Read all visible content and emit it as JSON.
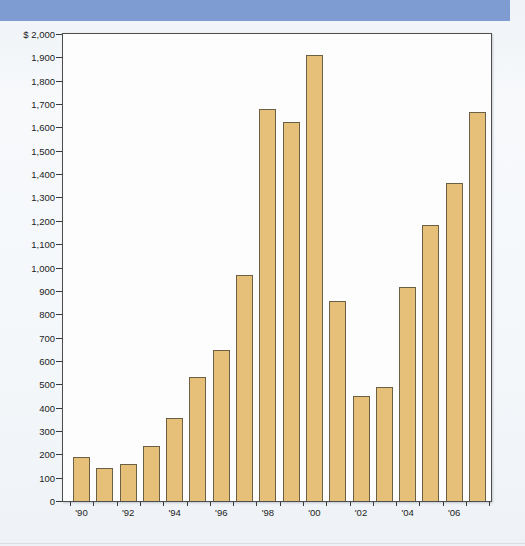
{
  "header": {
    "color": "#7e9bd2"
  },
  "colors": {
    "page_background": "#f2f5f8",
    "plot_background": "#fdfdfe",
    "plot_border": "#4d4d4d",
    "bar_fill": "#e6c078",
    "bar_border": "#6b6044",
    "axis": "#3a3a3a",
    "text": "#1c1c1c",
    "bottom_divider": "#d9dee3"
  },
  "chart_data": {
    "type": "bar",
    "title": "",
    "xlabel": "",
    "ylabel": "",
    "grid": false,
    "legend": null,
    "ylim": [
      0,
      2000
    ],
    "ytick_step": 100,
    "categories": [
      "'90",
      "'91",
      "'92",
      "'93",
      "'94",
      "'95",
      "'96",
      "'97",
      "'98",
      "'99",
      "'00",
      "'01",
      "'02",
      "'03",
      "'04",
      "'05",
      "'06",
      "'07"
    ],
    "values": [
      190,
      140,
      160,
      235,
      355,
      530,
      645,
      970,
      1680,
      1625,
      1910,
      855,
      450,
      490,
      915,
      1180,
      1360,
      1665
    ],
    "x_tick_labels": [
      "'90",
      "",
      "'92",
      "",
      "'94",
      "",
      "'96",
      "",
      "'98",
      "",
      "'00",
      "",
      "'02",
      "",
      "'04",
      "",
      "'06",
      ""
    ],
    "y_tick_values": [
      2000,
      1900,
      1800,
      1700,
      1600,
      1500,
      1400,
      1300,
      1200,
      1100,
      1000,
      900,
      800,
      700,
      600,
      500,
      400,
      300,
      200,
      100,
      0
    ],
    "y_tick_labels": [
      "$ 2,000",
      "1,900",
      "1,800",
      "1,700",
      "1,600",
      "1,500",
      "1,400",
      "1,300",
      "1,200",
      "1,100",
      "1,000",
      "900",
      "800",
      "700",
      "600",
      "500",
      "400",
      "300",
      "200",
      "100",
      "0"
    ]
  }
}
